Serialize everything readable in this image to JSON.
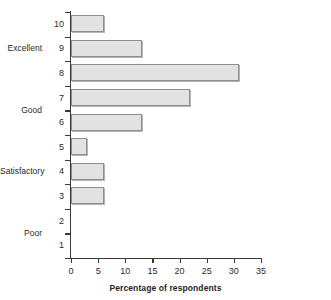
{
  "chart_data": {
    "type": "bar",
    "orientation": "horizontal",
    "title": "",
    "xlabel": "Percentage of respondents",
    "ylabel": "",
    "categories": [
      "1",
      "2",
      "3",
      "4",
      "5",
      "6",
      "7",
      "8",
      "9",
      "10"
    ],
    "values": [
      0,
      0,
      6,
      6,
      3,
      13,
      22,
      31,
      13,
      6
    ],
    "xlim": [
      0,
      35
    ],
    "xticks": [
      0,
      5,
      10,
      15,
      20,
      25,
      30,
      35
    ],
    "xtick_labels": [
      "0",
      "5",
      "10",
      "15",
      "20",
      "25",
      "30",
      "35"
    ],
    "grid": false,
    "legend": null,
    "bar_fill_color": "#e2e2e2",
    "bar_edge_color": "#8e8e8e",
    "axis_color": "#3a3a3a",
    "category_group_labels": [
      {
        "label": "Excellent",
        "at_rating": "9"
      },
      {
        "label": "Good",
        "at_rating": "6.5"
      },
      {
        "label": "Satisfactory",
        "at_rating": "4"
      },
      {
        "label": "Poor",
        "at_rating": "1.5"
      }
    ]
  }
}
